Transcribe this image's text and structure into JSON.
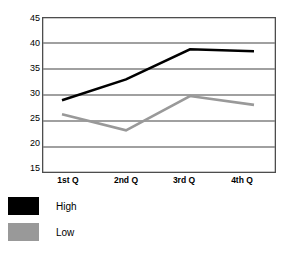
{
  "chart_data": {
    "type": "line",
    "title": "",
    "xlabel": "",
    "ylabel": "",
    "categories": [
      "1st Q",
      "2nd Q",
      "3rd Q",
      "4th Q"
    ],
    "ylim": [
      15,
      45
    ],
    "yticks": [
      15,
      20,
      25,
      30,
      35,
      40,
      45
    ],
    "grid": true,
    "legend_position": "bottom-left",
    "series": [
      {
        "name": "High",
        "color": "#000000",
        "values": [
          29,
          33,
          38.8,
          38.4
        ]
      },
      {
        "name": "Low",
        "color": "#999999",
        "values": [
          26.3,
          23.2,
          29.8,
          28.1
        ]
      }
    ]
  },
  "axis": {
    "y_tick_labels": [
      "45",
      "40",
      "35",
      "30",
      "25",
      "20",
      "15"
    ],
    "x_tick_labels": [
      "1st Q",
      "2nd Q",
      "3rd Q",
      "4th Q"
    ]
  },
  "legend": {
    "items": [
      {
        "label": "High",
        "color": "#000000"
      },
      {
        "label": "Low",
        "color": "#999999"
      }
    ]
  },
  "colors": {
    "high_series": "#000000",
    "low_series": "#999999",
    "gridline": "#808080",
    "frame": "#4d4d4d",
    "background": "#ffffff"
  }
}
